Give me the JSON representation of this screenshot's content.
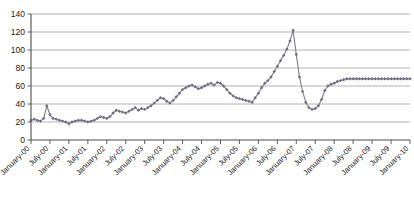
{
  "chart_data": {
    "type": "line",
    "title": "",
    "xlabel": "",
    "ylabel": "",
    "ylim": [
      0,
      140
    ],
    "ytick_step": 20,
    "yticks": [
      0,
      20,
      40,
      60,
      80,
      100,
      120,
      140
    ],
    "grid": true,
    "legend": false,
    "marker": "diamond",
    "line_color": "#808090",
    "marker_color": "#6e6e80",
    "gridline_color": "#b3b3b3",
    "axis_color": "#4d4d4d",
    "x_tick_labels": [
      "January-00",
      "July-00",
      "January-01",
      "July-01",
      "January-02",
      "July-02",
      "January-03",
      "July-03",
      "January-04",
      "July-04",
      "January-05",
      "July-05",
      "January-06",
      "July-06",
      "January-07",
      "July-07",
      "January-08",
      "July-08",
      "January-09",
      "July-09",
      "January-10"
    ],
    "x_tick_label_rotation": -45,
    "x_tick_interval_months": 6,
    "x_start": "January-00",
    "x_end": "January-10",
    "series": [
      {
        "name": "Series 1",
        "values": [
          22,
          23,
          22,
          21,
          24,
          38,
          28,
          24,
          23,
          22,
          21,
          20,
          18,
          20,
          21,
          22,
          22,
          21,
          20,
          21,
          22,
          24,
          26,
          25,
          24,
          26,
          30,
          33,
          32,
          31,
          30,
          32,
          34,
          36,
          33,
          35,
          34,
          36,
          38,
          41,
          44,
          47,
          46,
          43,
          41,
          44,
          48,
          52,
          56,
          58,
          60,
          61,
          59,
          57,
          58,
          60,
          62,
          63,
          61,
          64,
          63,
          60,
          56,
          52,
          49,
          47,
          46,
          45,
          44,
          43,
          42,
          47,
          52,
          58,
          63,
          66,
          70,
          76,
          82,
          88,
          94,
          101,
          110,
          122,
          95,
          70,
          54,
          42,
          36,
          34,
          35,
          38,
          45,
          55,
          60,
          62,
          63,
          65,
          66,
          67,
          68,
          68,
          68,
          68,
          68,
          68,
          68,
          68,
          68,
          68,
          68,
          68,
          68,
          68,
          68,
          68,
          68,
          68,
          68,
          68,
          68
        ]
      }
    ]
  }
}
